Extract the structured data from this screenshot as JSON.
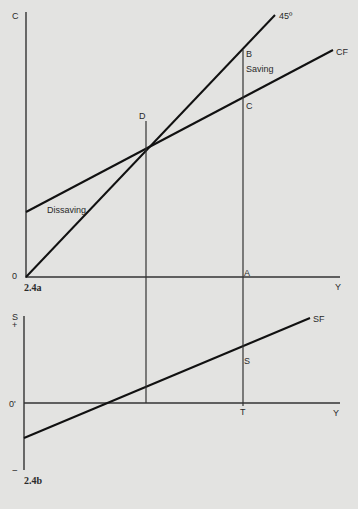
{
  "figure_a": {
    "caption": "2.4a",
    "y_axis_label": "C",
    "x_axis_label": "Y",
    "origin_label": "0",
    "line_45_label": "45º",
    "cf_label": "CF",
    "points": {
      "B": "B",
      "C": "C",
      "D": "D",
      "A": "A"
    },
    "region_labels": {
      "saving": "Saving",
      "dissaving": "Dissaving"
    }
  },
  "figure_b": {
    "caption": "2.4b",
    "y_axis_label": "S",
    "plus_sign": "+",
    "minus_sign": "−",
    "x_axis_label": "Y",
    "origin_label": "0'",
    "sf_label": "SF",
    "points": {
      "S": "S",
      "T": "T"
    }
  },
  "colors": {
    "background": "#e3e3e1",
    "ink": "#1e1e1e"
  }
}
